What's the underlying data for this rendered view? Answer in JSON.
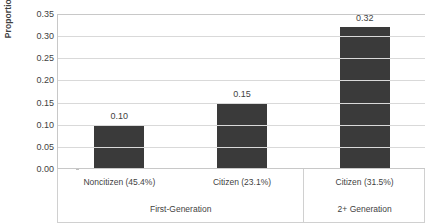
{
  "chart_data": {
    "type": "bar",
    "title": "",
    "xlabel": "",
    "ylabel": "Proportion",
    "ylim": [
      0.0,
      0.35
    ],
    "grid": true,
    "legend": "none",
    "categories": [
      "Noncitizen (45.4%)",
      "Citizen (23.1%)",
      "Citizen (31.5%)"
    ],
    "values": [
      0.1,
      0.15,
      0.32
    ],
    "value_labels": [
      "0.10",
      "0.15",
      "0.32"
    ],
    "groups": [
      {
        "label": "First-Generation",
        "span": 2
      },
      {
        "label": "2+ Generation",
        "span": 1
      }
    ],
    "yticks": [
      0.35,
      0.3,
      0.25,
      0.2,
      0.15,
      0.1,
      0.05,
      0.0
    ],
    "ytick_labels": [
      "0.35",
      "0.30",
      "0.25",
      "0.20",
      "0.15",
      "0.10",
      "0.05",
      "0.00"
    ],
    "colors": {
      "bar": "#3a3a3a",
      "gridline": "#d9d9d9",
      "axis": "#c8c8c8",
      "text": "#3f3f3f",
      "background": "#ffffff",
      "table_border": "#d0d0d0"
    }
  }
}
